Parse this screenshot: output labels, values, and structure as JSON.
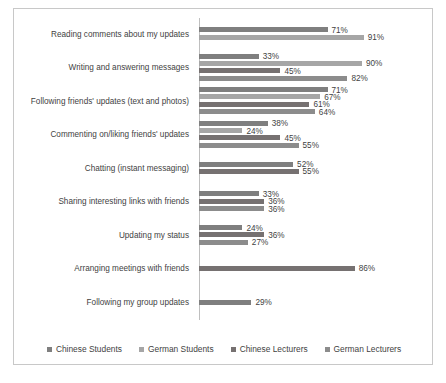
{
  "chart_data": {
    "type": "bar",
    "orientation": "horizontal",
    "title": "",
    "xlabel": "",
    "ylabel": "",
    "xlim": [
      0,
      100
    ],
    "grid": false,
    "legend_position": "bottom",
    "value_suffix": "%",
    "categories": [
      "Reading comments about my updates",
      "Writing and answering messages",
      "Following friends' updates (text and photos)",
      "Commenting on/liking friends' updates",
      "Chatting (instant messaging)",
      "Sharing interesting links with friends",
      "Updating my status",
      "Arranging meetings with friends",
      "Following my group updates"
    ],
    "series": [
      {
        "name": "Chinese Students",
        "color": "#7f7f7f",
        "values": [
          71,
          33,
          71,
          38,
          52,
          33,
          24,
          null,
          29
        ]
      },
      {
        "name": "German Students",
        "color": "#a6a6a6",
        "values": [
          91,
          90,
          67,
          24,
          null,
          null,
          null,
          null,
          null
        ]
      },
      {
        "name": "Chinese Lecturers",
        "color": "#767171",
        "values": [
          null,
          45,
          61,
          45,
          55,
          36,
          36,
          86,
          null
        ]
      },
      {
        "name": "German Lecturers",
        "color": "#8c8c8c",
        "values": [
          null,
          82,
          64,
          55,
          null,
          36,
          27,
          null,
          null
        ]
      }
    ],
    "labels": [
      [
        "71%",
        "91%",
        null,
        null
      ],
      [
        "33%",
        "90%",
        "45%",
        "82%"
      ],
      [
        "71%",
        "67%",
        "61%",
        "64%"
      ],
      [
        "38%",
        "24%",
        "45%",
        "55%"
      ],
      [
        "52%",
        null,
        "55%",
        null
      ],
      [
        "33%",
        null,
        "36%",
        "36%"
      ],
      [
        "24%",
        null,
        "36%",
        "27%"
      ],
      [
        null,
        null,
        "86%",
        null
      ],
      [
        "29%",
        null,
        null,
        null
      ]
    ]
  },
  "legend": {
    "items": [
      {
        "label": "Chinese Students",
        "color": "#7f7f7f"
      },
      {
        "label": "German Students",
        "color": "#a6a6a6"
      },
      {
        "label": "Chinese Lecturers",
        "color": "#767171"
      },
      {
        "label": "German Lecturers",
        "color": "#8c8c8c"
      }
    ]
  }
}
